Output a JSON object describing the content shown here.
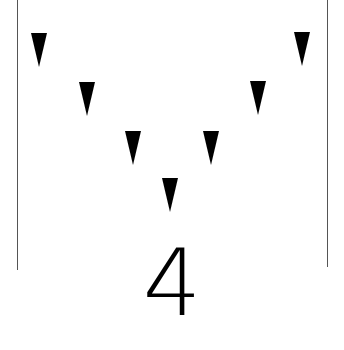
{
  "figure": {
    "count_label": "4",
    "colors": {
      "background": "#ffffff",
      "triangle": "#000000",
      "line": "#555555",
      "text": "#000000"
    },
    "triangles": [
      {
        "id": 1,
        "direction": "down",
        "left": 31,
        "top": 33
      },
      {
        "id": 2,
        "direction": "down",
        "left": 79,
        "top": 82
      },
      {
        "id": 3,
        "direction": "down",
        "left": 125,
        "top": 131
      },
      {
        "id": 4,
        "direction": "down",
        "left": 162,
        "top": 178
      },
      {
        "id": 5,
        "direction": "down",
        "left": 203,
        "top": 131
      },
      {
        "id": 6,
        "direction": "down",
        "left": 250,
        "top": 81
      },
      {
        "id": 7,
        "direction": "down",
        "left": 294,
        "top": 32
      }
    ],
    "boundary_lines": [
      "left",
      "right"
    ]
  }
}
